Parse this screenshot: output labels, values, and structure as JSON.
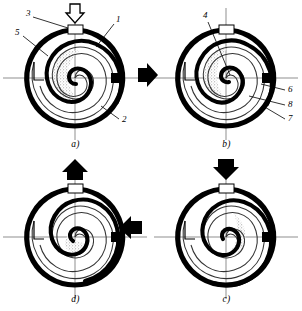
{
  "figure": {
    "type": "scroll-compressor-working-cycle",
    "panel_count": 4,
    "colors": {
      "stroke": "#000000",
      "background": "#ffffff",
      "thin_spiral": "#3a3a3a",
      "axis": "#8c8c8c",
      "stipple": "#9a9a9a"
    }
  },
  "panels": [
    {
      "id": "a",
      "caption": "a)",
      "position": "top-left",
      "phase_arrow": {
        "name": "suction-arrow",
        "direction": "down",
        "style": "hollow"
      },
      "callouts": [
        {
          "id": "3",
          "label": "3",
          "x": 26,
          "y": 14
        },
        {
          "id": "1",
          "label": "1",
          "x": 116,
          "y": 20
        },
        {
          "id": "5",
          "label": "5",
          "x": 16,
          "y": 32
        },
        {
          "id": "2",
          "label": "2",
          "x": 122,
          "y": 120
        }
      ]
    },
    {
      "id": "b",
      "caption": "b)",
      "position": "top-right",
      "phase_arrow": null,
      "callouts": [
        {
          "id": "4",
          "label": "4",
          "x": 52,
          "y": 16
        },
        {
          "id": "6",
          "label": "6",
          "x": 136,
          "y": 90
        },
        {
          "id": "8",
          "label": "8",
          "x": 136,
          "y": 105
        },
        {
          "id": "7",
          "label": "7",
          "x": 136,
          "y": 120
        }
      ]
    },
    {
      "id": "c",
      "caption": "c)",
      "position": "bottom-right",
      "phase_arrow": {
        "name": "compression-arrow",
        "direction": "down",
        "style": "solid"
      },
      "callouts": []
    },
    {
      "id": "d",
      "caption": "d)",
      "position": "bottom-left",
      "phase_arrow": {
        "name": "discharge-arrow",
        "direction": "up",
        "style": "solid"
      },
      "callouts": []
    }
  ],
  "flow_arrows": [
    {
      "name": "arrow-a-to-b",
      "direction": "right",
      "x": 138,
      "y": 70
    },
    {
      "name": "arrow-b-to-c",
      "direction": "down",
      "x": 213,
      "y": 158
    },
    {
      "name": "arrow-c-to-d",
      "direction": "left",
      "x": 118,
      "y": 222
    },
    {
      "name": "arrow-d-to-a",
      "direction": "up",
      "x": 62,
      "y": 158
    }
  ],
  "legend_numbers": [
    "1",
    "2",
    "3",
    "4",
    "5",
    "6",
    "7",
    "8"
  ]
}
